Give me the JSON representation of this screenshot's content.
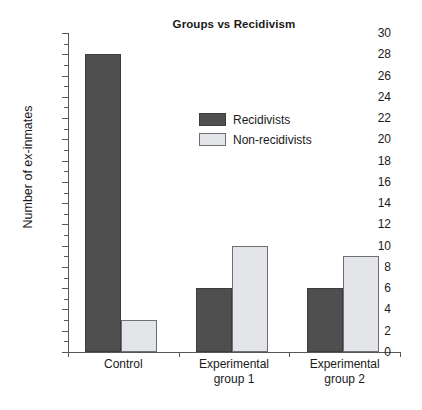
{
  "chart_data": {
    "type": "bar",
    "title": "Groups vs Recidivism",
    "xlabel": "",
    "ylabel": "Number of ex-inmates",
    "categories": [
      "Control",
      "Experimental group 1",
      "Experimental group 2"
    ],
    "category_lines": [
      [
        "Control"
      ],
      [
        "Experimental",
        "group 1"
      ],
      [
        "Experimental",
        "group 2"
      ]
    ],
    "series": [
      {
        "name": "Recidivists",
        "color": "#4f4f4f",
        "values": [
          28,
          6,
          6
        ]
      },
      {
        "name": "Non-recidivists",
        "color": "#e2e4e8",
        "values": [
          3,
          10,
          9
        ]
      }
    ],
    "ylim": [
      0,
      30
    ],
    "ytick_step": 2,
    "ytick_labels": [
      "0",
      "2",
      "4",
      "6",
      "8",
      "10",
      "12",
      "14",
      "16",
      "18",
      "20",
      "22",
      "24",
      "26",
      "28",
      "30"
    ],
    "yminor_step": 1,
    "grid": false,
    "legend_position": "upper-center"
  },
  "legend": {
    "entries": [
      {
        "label": "Recidivists",
        "swatch": "dark"
      },
      {
        "label": "Non-recidivists",
        "swatch": "light"
      }
    ]
  }
}
